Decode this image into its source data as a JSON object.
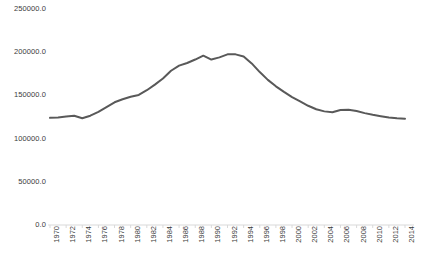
{
  "chart_data": {
    "type": "line",
    "title": "",
    "subtitle": "",
    "xlabel": "",
    "ylabel": "",
    "grid": false,
    "legend": null,
    "legend_position": "none",
    "line_color": "#595959",
    "axis_color": "#d9d9d9",
    "text_color": "#3b3b3b",
    "ylim": [
      0.0,
      250000.0
    ],
    "ytick_labels": [
      "250000.0",
      "200000.0",
      "150000.0",
      "100000.0",
      "50000.0",
      "0.0"
    ],
    "ytick_values": [
      250000.0,
      200000.0,
      150000.0,
      100000.0,
      50000.0,
      0.0
    ],
    "xtick_labels": [
      "1970",
      "1972",
      "1974",
      "1976",
      "1978",
      "1980",
      "1982",
      "1984",
      "1986",
      "1988",
      "1990",
      "1992",
      "1994",
      "1996",
      "1998",
      "2000",
      "2002",
      "2004",
      "2006",
      "2008",
      "2010",
      "2012",
      "2014"
    ],
    "x": [
      1970,
      1971,
      1972,
      1973,
      1974,
      1975,
      1976,
      1977,
      1978,
      1979,
      1980,
      1981,
      1982,
      1983,
      1984,
      1985,
      1986,
      1987,
      1988,
      1989,
      1990,
      1991,
      1992,
      1993,
      1994,
      1995,
      1996,
      1997,
      1998,
      1999,
      2000,
      2001,
      2002,
      2003,
      2004,
      2005,
      2006,
      2007,
      2008,
      2009,
      2010,
      2011,
      2012,
      2013,
      2014
    ],
    "values": [
      124000,
      124500,
      125500,
      126500,
      123500,
      126500,
      131000,
      136500,
      142000,
      145500,
      148500,
      150500,
      156000,
      162500,
      169500,
      178500,
      184500,
      187500,
      191500,
      196000,
      191500,
      194000,
      197500,
      197500,
      195000,
      187000,
      177000,
      168000,
      160500,
      154000,
      148000,
      143000,
      138000,
      134000,
      131500,
      130500,
      133000,
      133500,
      132000,
      129500,
      127500,
      126000,
      124500,
      123500,
      123000
    ],
    "series": [
      {
        "name": "series-1",
        "values": [
          124000,
          124500,
          125500,
          126500,
          123500,
          126500,
          131000,
          136500,
          142000,
          145500,
          148500,
          150500,
          156000,
          162500,
          169500,
          178500,
          184500,
          187500,
          191500,
          196000,
          191500,
          194000,
          197500,
          197500,
          195000,
          187000,
          177000,
          168000,
          160500,
          154000,
          148000,
          143000,
          138000,
          134000,
          131500,
          130500,
          133000,
          133500,
          132000,
          129500,
          127500,
          126000,
          124500,
          123500,
          123000
        ]
      }
    ]
  }
}
